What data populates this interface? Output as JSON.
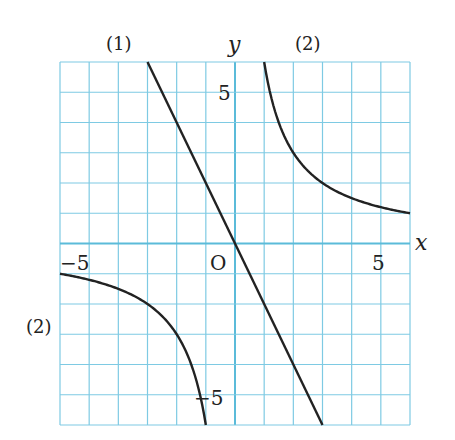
{
  "chart_data": {
    "type": "line",
    "title": "",
    "xlabel": "x",
    "ylabel": "y",
    "origin_label": "O",
    "xlim": [
      -6,
      6
    ],
    "ylim": [
      -6,
      6
    ],
    "grid": true,
    "grid_step": 1,
    "x_ticks": [
      {
        "value": -5,
        "label": "−5"
      },
      {
        "value": 5,
        "label": "5"
      }
    ],
    "y_ticks": [
      {
        "value": 5,
        "label": "5"
      },
      {
        "value": -5,
        "label": "−5"
      }
    ],
    "series": [
      {
        "name": "(1)",
        "equation": "y = -2x",
        "points": [
          [
            -3,
            6
          ],
          [
            0,
            0
          ],
          [
            3,
            -6
          ]
        ]
      },
      {
        "name": "(2)",
        "equation": "y = 6/x",
        "branches": [
          [
            [
              1,
              6
            ],
            [
              1.5,
              4
            ],
            [
              2,
              3
            ],
            [
              3,
              2
            ],
            [
              4,
              1.5
            ],
            [
              6,
              1
            ]
          ],
          [
            [
              -6,
              -1
            ],
            [
              -4,
              -1.5
            ],
            [
              -3,
              -2
            ],
            [
              -2,
              -3
            ],
            [
              -1.5,
              -4
            ],
            [
              -1,
              -6
            ]
          ]
        ]
      }
    ],
    "annotations": [
      "(1)",
      "(2)",
      "(2)"
    ],
    "colors": {
      "grid": "#7ecae3",
      "axis": "#5bbbd9",
      "curve": "#222222"
    }
  }
}
